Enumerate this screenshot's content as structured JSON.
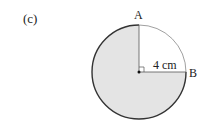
{
  "part_label": "(c)",
  "points": {
    "A": "A",
    "B": "B"
  },
  "radius_label": "4 cm",
  "figure": {
    "shape": "circle",
    "shaded_fraction": "3/4",
    "unshaded_quadrant": "top-right",
    "right_angle_at_center": true,
    "shade_color": "#e4e4e4",
    "stroke_color": "#333333"
  }
}
